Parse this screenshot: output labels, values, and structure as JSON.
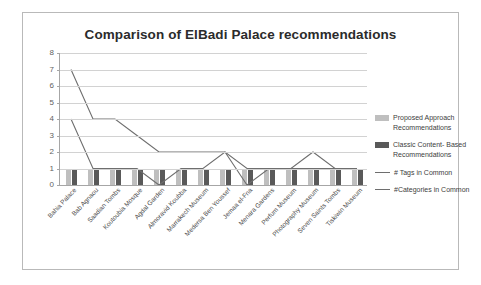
{
  "chart": {
    "title": "Comparison of ElBadi Palace recommendations",
    "frame_border_color": "#b9b9b9"
  },
  "legend": {
    "items": [
      {
        "label": "Proposed Approach Recommendations",
        "marker": "bar-swatch",
        "color": "#bfbfbf"
      },
      {
        "label": "Classic Content- Based Recommendations",
        "marker": "bar-swatch",
        "color": "#595959"
      },
      {
        "label": "# Tags in Common",
        "marker": "line",
        "color": "#6e6e6e"
      },
      {
        "label": "#Categories in Common",
        "marker": "line",
        "color": "#6e6e6e"
      }
    ]
  },
  "chart_data": {
    "type": "bar",
    "title": "Comparison of ElBadi Palace recommendations",
    "xlabel": "",
    "ylabel": "",
    "ylim": [
      0,
      8
    ],
    "yticks": [
      0,
      1,
      2,
      3,
      4,
      5,
      6,
      7,
      8
    ],
    "grid": true,
    "legend_position": "right",
    "categories": [
      "Bahia Palace",
      "Bab Agnaou",
      "Saadian Tombs",
      "Koutoubia Mosque",
      "Agdal Garden",
      "Almoravid Koubba",
      "Marrakech Museum",
      "Medersa Ben Youssef",
      "Jemaa el-Fna",
      "Menara Gardens",
      "Perfum Museum",
      "Photography Museum",
      "Seven Saints Tombs",
      "Tiskiwin Museum"
    ],
    "series": [
      {
        "name": "Proposed Approach Recommendations",
        "type": "bar",
        "color": "#bfbfbf",
        "values": [
          1,
          1,
          1,
          1,
          1,
          1,
          1,
          1,
          1,
          1,
          1,
          1,
          1,
          1
        ]
      },
      {
        "name": "Classic Content- Based Recommendations",
        "type": "bar",
        "color": "#595959",
        "values": [
          1,
          1,
          1,
          1,
          1,
          1,
          1,
          1,
          1,
          1,
          1,
          1,
          1,
          1
        ]
      },
      {
        "name": "# Tags in Common",
        "type": "line",
        "color": "#6e6e6e",
        "values": [
          7,
          4,
          4,
          3,
          2,
          2,
          2,
          2,
          1,
          1,
          1,
          1,
          1,
          1
        ]
      },
      {
        "name": "#Categories in Common",
        "type": "line",
        "color": "#6e6e6e",
        "values": [
          4,
          1,
          1,
          1,
          0,
          1,
          1,
          2,
          0,
          1,
          1,
          2,
          1,
          1
        ]
      }
    ]
  }
}
